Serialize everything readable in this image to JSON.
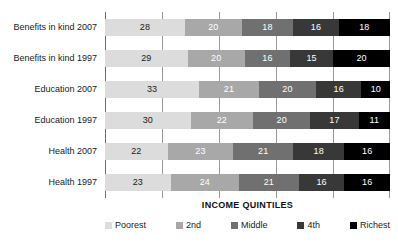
{
  "chart_data": {
    "type": "bar",
    "orientation": "horizontal",
    "stacked": true,
    "stack_mode": "percent",
    "title": "",
    "subtitle": "",
    "xlabel": "INCOME QUINTILES",
    "ylabel": "",
    "xlim": [
      0,
      100
    ],
    "xticks": [
      0,
      20,
      40,
      60,
      80,
      100
    ],
    "xtick_labels": [
      "",
      "",
      "",
      "",
      "",
      ""
    ],
    "grid": true,
    "grid_axis": "x",
    "legend_position": "bottom",
    "categories": [
      "Benefits in kind 2007",
      "Benefits in kind 1997",
      "Education 2007",
      "Education 1997",
      "Health 2007",
      "Health 1997"
    ],
    "series": [
      {
        "name": "Poorest",
        "color": "#dcdcdc",
        "label_color": "#1a1a1a",
        "values": [
          28,
          29,
          33,
          30,
          22,
          23
        ]
      },
      {
        "name": "2nd",
        "color": "#a8a8a8",
        "label_color": "#ffffff",
        "values": [
          20,
          20,
          21,
          22,
          23,
          24
        ]
      },
      {
        "name": "Middle",
        "color": "#707070",
        "label_color": "#ffffff",
        "values": [
          18,
          16,
          20,
          20,
          21,
          21
        ]
      },
      {
        "name": "4th",
        "color": "#383838",
        "label_color": "#ffffff",
        "values": [
          16,
          15,
          16,
          17,
          18,
          16
        ]
      },
      {
        "name": "Richest",
        "color": "#000000",
        "label_color": "#ffffff",
        "values": [
          18,
          20,
          10,
          11,
          16,
          16
        ]
      }
    ],
    "row_totals": [
      100,
      100,
      100,
      100,
      100,
      100
    ],
    "data_labels_shown": true
  },
  "axis": {
    "title": "INCOME QUINTILES"
  },
  "legend": {
    "items": [
      {
        "label": "Poorest",
        "color": "#dcdcdc"
      },
      {
        "label": "2nd",
        "color": "#a8a8a8"
      },
      {
        "label": "Middle",
        "color": "#707070"
      },
      {
        "label": "4th",
        "color": "#383838"
      },
      {
        "label": "Richest",
        "color": "#000000"
      }
    ]
  }
}
